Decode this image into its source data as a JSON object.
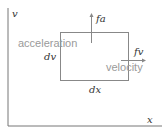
{
  "diagram": {
    "axes": {
      "y_label": "v",
      "x_label": "x"
    },
    "box": {
      "left_label": "dv",
      "bottom_label": "dx"
    },
    "vectors": {
      "vertical": {
        "label": "fa",
        "description": "acceleration"
      },
      "horizontal": {
        "label": "fv",
        "description": "velocity"
      }
    },
    "colors": {
      "axis": "#777777",
      "box": "#888888",
      "arrow": "#888888",
      "math_text": "#333333",
      "label_text": "#9a9a9a",
      "background": "#ffffff"
    }
  }
}
